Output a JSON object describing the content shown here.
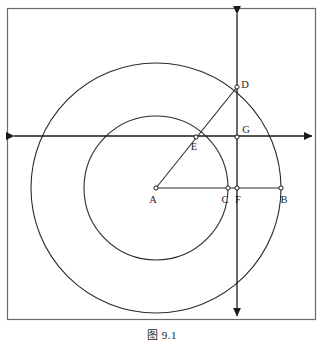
{
  "figure": {
    "caption": "图 9.1",
    "caption_number": "9.1",
    "background_color": "#ffffff",
    "stroke_color": "#2b2b2b",
    "frame_color": "#555555"
  },
  "frame": {
    "x": 7,
    "y": 8,
    "width": 309,
    "height": 312
  },
  "axes": {
    "horizontal": {
      "label": "horizontal-axis",
      "y": 136,
      "x_start": 10,
      "x_end": 316,
      "arrows": "both"
    },
    "vertical": {
      "label": "vertical-axis",
      "x": 237,
      "y_start": 10,
      "y_end": 320,
      "arrows": "both"
    }
  },
  "circles": [
    {
      "name": "outer-circle",
      "center_x": 156,
      "center_y": 188,
      "radius": 125
    },
    {
      "name": "inner-circle",
      "center_x": 156,
      "center_y": 188,
      "radius": 72
    }
  ],
  "segments": [
    {
      "name": "segment-AB",
      "x1": 156,
      "y1": 188,
      "x2": 281,
      "y2": 188
    },
    {
      "name": "segment-AD",
      "x1": 156,
      "y1": 188,
      "x2": 237,
      "y2": 87
    },
    {
      "name": "segment-DG",
      "x1": 237,
      "y1": 87,
      "x2": 237,
      "y2": 137
    }
  ],
  "points": [
    {
      "id": "A",
      "label": "A",
      "x": 156,
      "y": 188,
      "label_dx": -3,
      "label_dy": 15,
      "role": "center"
    },
    {
      "id": "C",
      "label": "C",
      "x": 228,
      "y": 188,
      "label_dx": -3,
      "label_dy": 15,
      "role": "inner-circle-intersection"
    },
    {
      "id": "F",
      "label": "F",
      "x": 237,
      "y": 188,
      "label_dx": 1,
      "label_dy": 15,
      "role": "vertical-axis-point"
    },
    {
      "id": "B",
      "label": "B",
      "x": 281,
      "y": 188,
      "label_dx": 3,
      "label_dy": 15,
      "role": "outer-circle-point"
    },
    {
      "id": "E",
      "label": "E",
      "x": 196,
      "y": 137,
      "label_dx": -2,
      "label_dy": 13,
      "role": "inner-circle-axis-intersection"
    },
    {
      "id": "G",
      "label": "G",
      "x": 237,
      "y": 137,
      "label_dx": 4,
      "label_dy": -4,
      "role": "axes-origin"
    },
    {
      "id": "D",
      "label": "D",
      "x": 237,
      "y": 87,
      "label_dx": 5,
      "label_dy": 1,
      "role": "outer-circle-axis-intersection"
    }
  ]
}
